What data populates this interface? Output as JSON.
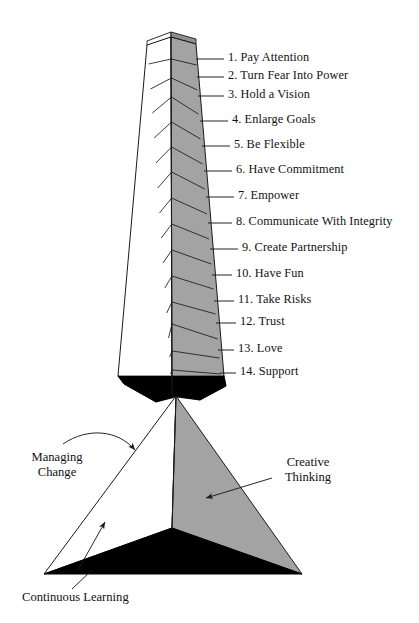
{
  "diagram": {
    "colors": {
      "face_light": "#ffffff",
      "face_gray": "#a3a3a3",
      "face_dark": "#000000",
      "outline": "#1a1a1a",
      "text": "#111111"
    },
    "column": {
      "name": "numbered-tower",
      "segment_count": 14,
      "items": [
        {
          "num": "1.",
          "text": "Pay Attention",
          "label": "1. Pay Attention",
          "y": 57,
          "tip_y": 59,
          "tip_x": 196
        },
        {
          "num": "2.",
          "text": "Turn Fear Into Power",
          "label": "2. Turn Fear Into Power",
          "y": 75,
          "tip_y": 77,
          "tip_x": 197
        },
        {
          "num": "3.",
          "text": "Hold a Vision",
          "label": "3. Hold a Vision",
          "y": 94,
          "tip_y": 96,
          "tip_x": 198
        },
        {
          "num": "4.",
          "text": "Enlarge Goals",
          "label": "4. Enlarge Goals",
          "y": 119,
          "tip_y": 121,
          "tip_x": 200
        },
        {
          "num": "5.",
          "text": "Be Flexible",
          "label": "5. Be Flexible",
          "y": 144,
          "tip_y": 146,
          "tip_x": 202
        },
        {
          "num": "6.",
          "text": "Have Commitment",
          "label": "6. Have Commitment",
          "y": 169,
          "tip_y": 171,
          "tip_x": 204
        },
        {
          "num": "7.",
          "text": "Empower",
          "label": "7. Empower",
          "y": 195,
          "tip_y": 197,
          "tip_x": 206
        },
        {
          "num": "8.",
          "text": "Communicate With Integrity",
          "label": "8. Communicate With Integrity",
          "y": 221,
          "tip_y": 223,
          "tip_x": 208
        },
        {
          "num": "9.",
          "text": "Create Partnership",
          "label": "9. Create Partnership",
          "y": 247,
          "tip_y": 249,
          "tip_x": 210
        },
        {
          "num": "10.",
          "text": "Have Fun",
          "label": "10. Have Fun",
          "y": 273,
          "tip_y": 275,
          "tip_x": 212
        },
        {
          "num": "11.",
          "text": "Take Risks",
          "label": "11. Take Risks",
          "y": 299,
          "tip_y": 301,
          "tip_x": 214
        },
        {
          "num": "12.",
          "text": "Trust",
          "label": "12. Trust",
          "y": 321,
          "tip_y": 323,
          "tip_x": 216
        },
        {
          "num": "13.",
          "text": "Love",
          "label": "13. Love",
          "y": 348,
          "tip_y": 350,
          "tip_x": 218
        },
        {
          "num": "14.",
          "text": "Support",
          "label": "14. Support",
          "y": 371,
          "tip_y": 373,
          "tip_x": 220
        }
      ],
      "label_x": 228
    },
    "pyramid": {
      "name": "base-pyramid",
      "faces": [
        {
          "name": "left-face",
          "label": "Managing Change",
          "shade": "light"
        },
        {
          "name": "right-face",
          "label": "Creative Thinking",
          "shade": "gray"
        },
        {
          "name": "base-face",
          "label": "Continuous Learning",
          "shade": "dark"
        }
      ],
      "labels": {
        "managing_change_line1": "Managing",
        "managing_change_line2": "Change",
        "creative_thinking_line1": "Creative",
        "creative_thinking_line2": "Thinking",
        "continuous_learning": "Continuous Learning"
      }
    }
  }
}
